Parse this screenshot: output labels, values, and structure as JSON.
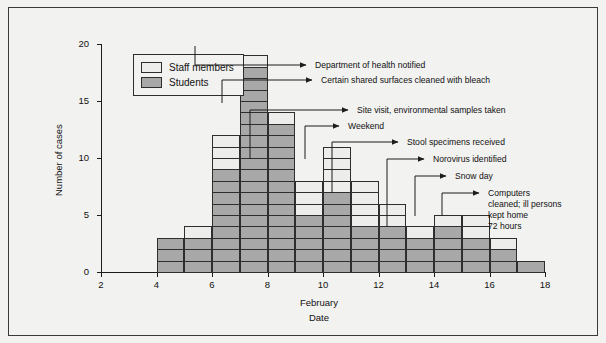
{
  "chart_data": {
    "type": "bar",
    "title": "",
    "subtitle": "",
    "xlabel_lines": [
      "February",
      "Date"
    ],
    "ylabel": "Number of cases",
    "xlim": [
      2,
      18
    ],
    "ylim": [
      0,
      20
    ],
    "xticks": [
      2,
      4,
      6,
      8,
      10,
      12,
      14,
      16,
      18
    ],
    "yticks": [
      0,
      5,
      10,
      15,
      20
    ],
    "grid": false,
    "legend_position": "top-left",
    "stacked": true,
    "categories": [
      4,
      5,
      6,
      7,
      8,
      9,
      10,
      11,
      12,
      13,
      14,
      15,
      16,
      17
    ],
    "series": [
      {
        "name": "Students",
        "color": "#a8a8a8",
        "values": [
          3,
          3,
          9,
          18,
          13,
          5,
          7,
          4,
          4,
          3,
          4,
          3,
          2,
          1
        ]
      },
      {
        "name": "Staff members",
        "color": "#ededeb",
        "values": [
          0,
          1,
          3,
          1,
          1,
          3,
          4,
          4,
          2,
          1,
          1,
          2,
          1,
          0
        ]
      }
    ],
    "totals": [
      3,
      4,
      12,
      19,
      14,
      8,
      11,
      8,
      6,
      4,
      5,
      5,
      3,
      1
    ],
    "annotations": [
      {
        "text": "Department of health notified",
        "date": 7
      },
      {
        "text": "Certain shared surfaces cleaned with bleach",
        "date": 8
      },
      {
        "text": "Site visit, environmental samples taken",
        "date": 9
      },
      {
        "text": "Weekend",
        "date": 11
      },
      {
        "text": "Stool specimens received",
        "date": 11
      },
      {
        "text": "Norovirus identified",
        "date": 13
      },
      {
        "text": "Snow day",
        "date": 14
      },
      {
        "text": "Computers cleaned; ill persons kept home 72 hours",
        "date": 15
      }
    ]
  },
  "legend": {
    "items": [
      {
        "label": "Staff members",
        "key": "staff"
      },
      {
        "label": "Students",
        "key": "students"
      }
    ]
  },
  "axes": {
    "y_title": "Number of cases",
    "y_ticks": [
      "0",
      "5",
      "10",
      "15",
      "20"
    ],
    "x_ticks": [
      "2",
      "4",
      "6",
      "8",
      "10",
      "12",
      "14",
      "16",
      "18"
    ],
    "x_title_line1": "February",
    "x_title_line2": "Date"
  },
  "annotations": {
    "a1": "Department of health notified",
    "a2": "Certain shared surfaces cleaned with bleach",
    "a3": "Site visit, environmental samples taken",
    "a4": "Weekend",
    "a5": "Stool specimens received",
    "a6": "Norovirus identified",
    "a7": "Snow day",
    "a8_l1": "Computers",
    "a8_l2": "cleaned; ill persons",
    "a8_l3": "kept home",
    "a8_l4": "72 hours"
  }
}
